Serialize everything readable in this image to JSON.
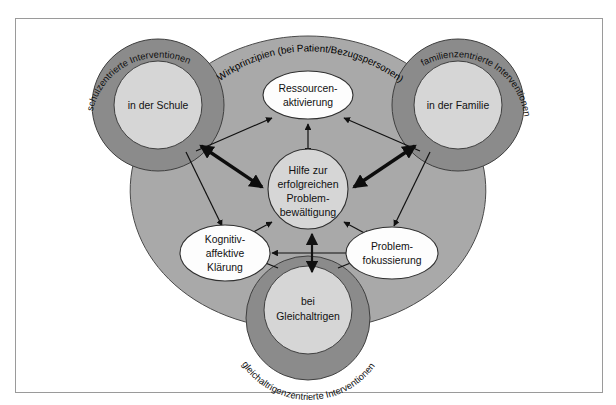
{
  "figure": {
    "type": "concept-diagram",
    "language": "de"
  },
  "arc_label": "Wirkprinzipien (bei Patient/Bezugspersonen)",
  "corners": [
    {
      "id": "schule",
      "ring_label": "schulzentrierte Interventionen",
      "core_label": "in der Schule",
      "position": "top-left"
    },
    {
      "id": "familie",
      "ring_label": "familienzentrierte Interventionen",
      "core_label": "in der Familie",
      "position": "top-right"
    },
    {
      "id": "gleichaltrige",
      "ring_label": "gleichaltrigenzentrierte Interventionen",
      "core_label_line1": "bei",
      "core_label_line2": "Gleichaltrigen",
      "position": "bottom"
    }
  ],
  "hub": {
    "id": "hilfe",
    "lines": [
      "Hilfe zur",
      "erfolgreichen",
      "Problem-",
      "bewältigung"
    ]
  },
  "principles": [
    {
      "id": "ressourcen",
      "lines": [
        "Ressourcen-",
        "aktivierung"
      ],
      "position": "top"
    },
    {
      "id": "kognitiv",
      "lines": [
        "Kognitiv-",
        "affektive",
        "Klärung"
      ],
      "position": "bottom-left"
    },
    {
      "id": "problemfokus",
      "lines": [
        "Problem-",
        "fokussierung"
      ],
      "position": "bottom-right"
    }
  ],
  "colors": {
    "ring": "#8b8b8b",
    "core": "#d6d6d6",
    "body": "#a9a9a9",
    "ellipse": "#fdfdfd",
    "outline": "#3a3a3a",
    "frame": "#9a9a9a",
    "arrow": "#111111",
    "page": "#ffffff"
  }
}
